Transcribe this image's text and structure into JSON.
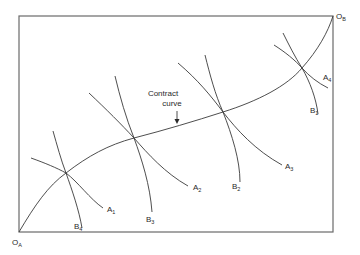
{
  "diagram": {
    "type": "edgeworth-box",
    "origins": {
      "a": {
        "label": "O",
        "sub": "A"
      },
      "b": {
        "label": "O",
        "sub": "B"
      }
    },
    "contract_curve_label": [
      "Contract",
      "curve"
    ],
    "indifference_curves": {
      "A": [
        {
          "label": "A",
          "sub": "1"
        },
        {
          "label": "A",
          "sub": "2"
        },
        {
          "label": "A",
          "sub": "3"
        },
        {
          "label": "A",
          "sub": "4"
        }
      ],
      "B": [
        {
          "label": "B",
          "sub": "1"
        },
        {
          "label": "B",
          "sub": "2"
        },
        {
          "label": "B",
          "sub": "3"
        },
        {
          "label": "B",
          "sub": "4"
        }
      ]
    },
    "tangency_points": [
      "A1-B4",
      "A2-B3",
      "A3-B2",
      "A4-B1"
    ],
    "colors": {
      "line": "#3a3a3a",
      "box": "#6a6a6a",
      "text": "#2a2a2a"
    }
  }
}
